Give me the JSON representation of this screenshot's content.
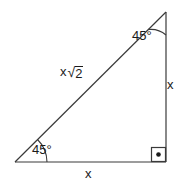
{
  "diagram": {
    "type": "right-isosceles-triangle",
    "background_color": "#ffffff",
    "stroke_color": "#3a3a3a",
    "text_color": "#1a1a1a",
    "vertices": {
      "top": {
        "x": 166,
        "y": 12
      },
      "bottom_left": {
        "x": 15,
        "y": 162
      },
      "bottom_right": {
        "x": 166,
        "y": 162
      }
    },
    "angles": {
      "top_label": "45°",
      "bottom_left_label": "45°",
      "bottom_right_marker": "right-angle-square-dot"
    },
    "sides": {
      "hypotenuse_base": "x",
      "hypotenuse_radical_sign": "√",
      "hypotenuse_radicand": "2",
      "right_leg_label": "x",
      "bottom_leg_label": "x"
    }
  }
}
